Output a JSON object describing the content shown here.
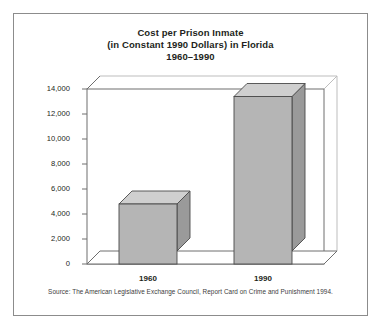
{
  "figure": {
    "border_color": "#8c8c8c",
    "background": "#ffffff"
  },
  "title": {
    "line1": "Cost per Prison Inmate",
    "line2": "(in Constant 1990 Dollars) in Florida",
    "line3": "1960–1990"
  },
  "source": {
    "text": "Source: The American Legislative Exchange Council, Report Card on Crime and Punishment 1994."
  },
  "axis": {
    "y_ticks": [
      "14,000",
      "12,000",
      "10,000",
      "8,000",
      "6,000",
      "4,000",
      "2,000",
      "0"
    ],
    "x_ticks": [
      "1960",
      "1990"
    ]
  },
  "colors": {
    "bar_front": "#b5b5b5",
    "bar_top": "#cfcfcf",
    "bar_side": "#9a9a9a",
    "bar_outline": "#4a4a4a",
    "axis_line": "#6e6e6e",
    "floor": "#ffffff",
    "text": "#231f20"
  },
  "chart_data": {
    "type": "bar",
    "title": "Cost per Prison Inmate (in Constant 1990 Dollars) in Florida 1960–1990",
    "subtitle": "1960–1990",
    "categories": [
      "1960",
      "1990"
    ],
    "values": [
      4800,
      13400
    ],
    "value_labels": [
      "",
      ""
    ],
    "xlabel": "",
    "ylabel": "",
    "ylim": [
      0,
      14000
    ],
    "ytick_values": [
      0,
      2000,
      4000,
      6000,
      8000,
      10000,
      12000,
      14000
    ],
    "grid": false,
    "legend": null,
    "style": "3d-column",
    "units": "Constant 1990 U.S. dollars",
    "annotations": [
      "Source: The American Legislative Exchange Council, Report Card on Crime and Punishment 1994."
    ]
  }
}
